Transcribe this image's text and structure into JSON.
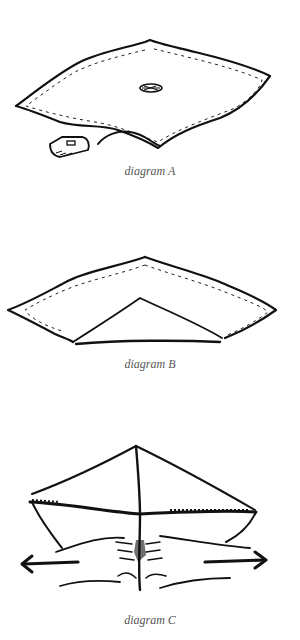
{
  "diagrams": [
    {
      "id": "A",
      "caption": "diagram A",
      "elements": [
        "fabric-square",
        "stitching-border",
        "center-button",
        "trailing-cord",
        "pad"
      ]
    },
    {
      "id": "B",
      "caption": "diagram B",
      "elements": [
        "folded-fabric",
        "stitching-border",
        "inner-triangle-fold"
      ]
    },
    {
      "id": "C",
      "caption": "diagram C",
      "elements": [
        "folded-fabric",
        "center-crease",
        "hands-pinching",
        "left-arrow",
        "right-arrow"
      ]
    }
  ],
  "colors": {
    "ink": "#111111",
    "caption": "#555555",
    "background": "#ffffff"
  }
}
